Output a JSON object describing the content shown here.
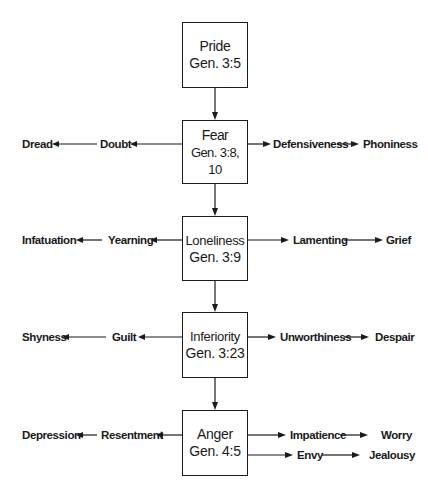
{
  "diagram": {
    "type": "flowchart",
    "nodes": [
      {
        "id": "pride",
        "title": "Pride",
        "ref": "Gen. 3:5"
      },
      {
        "id": "fear",
        "title": "Fear",
        "ref": "Gen. 3:8, 10"
      },
      {
        "id": "loneliness",
        "title": "Loneliness",
        "ref": "Gen. 3:9"
      },
      {
        "id": "inferiority",
        "title": "Inferiority",
        "ref": "Gen. 3:23"
      },
      {
        "id": "anger",
        "title": "Anger",
        "ref": "Gen. 4:5"
      }
    ],
    "branches": {
      "fear": {
        "left": [
          "Doubt",
          "Dread"
        ],
        "right": [
          "Defensiveness",
          "Phoniness"
        ]
      },
      "loneliness": {
        "left": [
          "Yearning",
          "Infatuation"
        ],
        "right": [
          "Lamenting",
          "Grief"
        ]
      },
      "inferiority": {
        "left": [
          "Guilt",
          "Shyness"
        ],
        "right": [
          "Unworthiness",
          "Despair"
        ]
      },
      "anger": {
        "left": [
          "Resentment",
          "Depression"
        ],
        "right": [
          "Impatience",
          "Worry"
        ],
        "right2": [
          "Envy",
          "Jealousy"
        ]
      }
    },
    "edges": [
      [
        "Pride",
        "Fear"
      ],
      [
        "Fear",
        "Loneliness"
      ],
      [
        "Loneliness",
        "Inferiority"
      ],
      [
        "Inferiority",
        "Anger"
      ],
      [
        "Fear",
        "Doubt"
      ],
      [
        "Doubt",
        "Dread"
      ],
      [
        "Fear",
        "Defensiveness"
      ],
      [
        "Defensiveness",
        "Phoniness"
      ],
      [
        "Loneliness",
        "Yearning"
      ],
      [
        "Yearning",
        "Infatuation"
      ],
      [
        "Loneliness",
        "Lamenting"
      ],
      [
        "Lamenting",
        "Grief"
      ],
      [
        "Inferiority",
        "Guilt"
      ],
      [
        "Guilt",
        "Shyness"
      ],
      [
        "Inferiority",
        "Unworthiness"
      ],
      [
        "Unworthiness",
        "Despair"
      ],
      [
        "Anger",
        "Resentment"
      ],
      [
        "Resentment",
        "Depression"
      ],
      [
        "Anger",
        "Impatience"
      ],
      [
        "Impatience",
        "Worry"
      ],
      [
        "Anger",
        "Envy"
      ],
      [
        "Envy",
        "Jealousy"
      ]
    ]
  }
}
